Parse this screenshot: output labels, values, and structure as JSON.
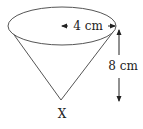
{
  "diagram": {
    "type": "cone",
    "radius_label": "4 cm",
    "height_label": "8 cm",
    "apex_label": "X",
    "colors": {
      "stroke": "#555555",
      "fill": "#ffffff",
      "text": "#222222"
    }
  }
}
